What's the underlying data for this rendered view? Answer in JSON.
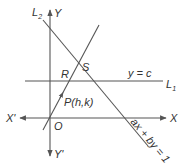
{
  "figure": {
    "axes": {
      "x_pos_label": "X",
      "x_neg_label": "X'",
      "y_pos_label": "Y",
      "y_neg_label": "Y'",
      "origin_label": "O"
    },
    "lines": {
      "l1_name": "L",
      "l1_sub": "1",
      "l1_equation": "y = c",
      "l2_name": "L",
      "l2_sub": "2",
      "l2_equation": "ax + by = 1"
    },
    "points": {
      "r_label": "R",
      "s_label": "S",
      "p_label": "P(h,k)"
    },
    "colors": {
      "stroke": "#555555",
      "text": "#333333",
      "background": "#ffffff"
    }
  }
}
